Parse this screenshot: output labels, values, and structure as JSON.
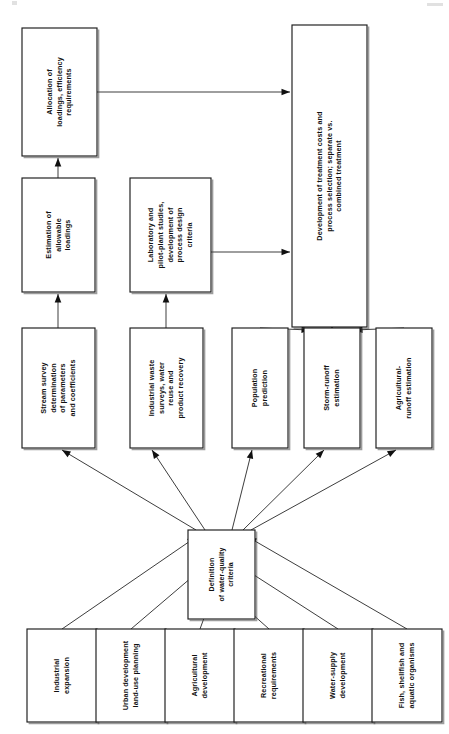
{
  "figure": {
    "orientation": "text-rotated-90-ccw",
    "page_width": 449,
    "page_height": 734,
    "ink_color": "#1a1a1a",
    "paper_color": "#ffffff"
  },
  "nodes": {
    "allocation": {
      "id": "allocation",
      "lines": [
        "Allocation of",
        "loadings, efficiency",
        "requirements"
      ],
      "x": 22,
      "y": 28,
      "w": 75,
      "h": 128,
      "font": 7.2
    },
    "treatment": {
      "id": "treatment",
      "lines": [
        "Development of treatment costs and",
        "process selection; separate vs.",
        "combined treatment"
      ],
      "x": 292,
      "y": 25,
      "w": 75,
      "h": 302,
      "font": 7.2
    },
    "estimation": {
      "id": "estimation",
      "lines": [
        "Estimation of",
        "allowable",
        "loadings"
      ],
      "x": 22,
      "y": 178,
      "w": 73,
      "h": 114,
      "font": 7.2
    },
    "laboratory": {
      "id": "laboratory",
      "lines": [
        "Laboratory and",
        "pilot-plant studies,",
        "development of",
        "process design",
        "criteria"
      ],
      "x": 130,
      "y": 178,
      "w": 81,
      "h": 114,
      "font": 7.2
    },
    "stream_survey": {
      "id": "stream_survey",
      "lines": [
        "Stream survey",
        "determination",
        "of parameters",
        "and coefficients"
      ],
      "x": 22,
      "y": 328,
      "w": 73,
      "h": 120,
      "font": 7.2
    },
    "industrial_waste": {
      "id": "industrial_waste",
      "lines": [
        "Industrial waste",
        "surveys, water",
        "reuse and",
        "product recovery"
      ],
      "x": 130,
      "y": 328,
      "w": 73,
      "h": 120,
      "font": 7.2
    },
    "population": {
      "id": "population",
      "lines": [
        "Population",
        "prediction"
      ],
      "x": 232,
      "y": 328,
      "w": 56,
      "h": 120,
      "font": 7.2
    },
    "storm_runoff": {
      "id": "storm_runoff",
      "lines": [
        "Storm-runoff",
        "estimation"
      ],
      "x": 304,
      "y": 328,
      "w": 56,
      "h": 120,
      "font": 7.2
    },
    "agri_runoff": {
      "id": "agri_runoff",
      "lines": [
        "Agricultural-",
        "runoff estimation"
      ],
      "x": 376,
      "y": 328,
      "w": 56,
      "h": 120,
      "font": 7.2
    },
    "definition": {
      "id": "definition",
      "lines": [
        "Definition",
        "of water-quality",
        "criteria"
      ],
      "x": 188,
      "y": 530,
      "w": 67,
      "h": 89,
      "font": 7.0
    },
    "industrial_expansion": {
      "id": "industrial_expansion",
      "lines": [
        "Industrial",
        "expansion"
      ],
      "x": 27,
      "y": 629,
      "w": 70,
      "h": 93,
      "font": 7.2
    },
    "urban_development": {
      "id": "urban_development",
      "lines": [
        "Urban development",
        "land-use planning"
      ],
      "x": 96,
      "y": 629,
      "w": 70,
      "h": 93,
      "font": 7.2
    },
    "agricultural_development": {
      "id": "agricultural_development",
      "lines": [
        "Agricultural",
        "development"
      ],
      "x": 165,
      "y": 629,
      "w": 70,
      "h": 93,
      "font": 7.2
    },
    "recreational": {
      "id": "recreational",
      "lines": [
        "Recreational",
        "requirements"
      ],
      "x": 234,
      "y": 629,
      "w": 70,
      "h": 93,
      "font": 7.2
    },
    "water_supply": {
      "id": "water_supply",
      "lines": [
        "Water-supply",
        "development"
      ],
      "x": 303,
      "y": 629,
      "w": 70,
      "h": 93,
      "font": 7.2
    },
    "fish_shellfish": {
      "id": "fish_shellfish",
      "lines": [
        "Fish, shellfish and",
        "aquatic organisms"
      ],
      "x": 372,
      "y": 629,
      "w": 70,
      "h": 93,
      "font": 7.2
    }
  },
  "edges": [
    {
      "id": "e-ind-exp-def",
      "from": "industrial_expansion",
      "to": "definition",
      "points": [
        [
          62,
          629
        ],
        [
          196,
          537
        ]
      ],
      "arrow": "end"
    },
    {
      "id": "e-urban-def",
      "from": "urban_development",
      "to": "definition",
      "points": [
        [
          131,
          629
        ],
        [
          205,
          566
        ]
      ],
      "arrow": "end"
    },
    {
      "id": "e-agri-dev-def",
      "from": "agricultural_development",
      "to": "definition",
      "points": [
        [
          200,
          629
        ],
        [
          212,
          596
        ]
      ],
      "arrow": "end"
    },
    {
      "id": "e-recr-def",
      "from": "recreational",
      "to": "definition",
      "points": [
        [
          269,
          629
        ],
        [
          232,
          596
        ]
      ],
      "arrow": "end"
    },
    {
      "id": "e-water-def",
      "from": "water_supply",
      "to": "definition",
      "points": [
        [
          338,
          629
        ],
        [
          240,
          566
        ]
      ],
      "arrow": "end"
    },
    {
      "id": "e-fish-def",
      "from": "fish_shellfish",
      "to": "definition",
      "points": [
        [
          407,
          629
        ],
        [
          248,
          537
        ]
      ],
      "arrow": "end"
    },
    {
      "id": "e-def-stream",
      "from": "definition",
      "to": "stream_survey",
      "points": [
        [
          196,
          530
        ],
        [
          62,
          450
        ]
      ],
      "arrow": "end"
    },
    {
      "id": "e-def-indwaste",
      "from": "definition",
      "to": "industrial_waste",
      "points": [
        [
          205,
          530
        ],
        [
          152,
          450
        ]
      ],
      "arrow": "end"
    },
    {
      "id": "e-def-pop",
      "from": "definition",
      "to": "population",
      "points": [
        [
          232,
          530
        ],
        [
          252,
          450
        ]
      ],
      "arrow": "end"
    },
    {
      "id": "e-def-storm",
      "from": "definition",
      "to": "storm_runoff",
      "points": [
        [
          243,
          530
        ],
        [
          324,
          450
        ]
      ],
      "arrow": "end"
    },
    {
      "id": "e-def-agri",
      "from": "definition",
      "to": "agri_runoff",
      "points": [
        [
          251,
          530
        ],
        [
          396,
          450
        ]
      ],
      "arrow": "end"
    },
    {
      "id": "e-stream-est",
      "from": "stream_survey",
      "to": "estimation",
      "points": [
        [
          58,
          328
        ],
        [
          58,
          294
        ]
      ],
      "arrow": "end"
    },
    {
      "id": "e-indwaste-lab",
      "from": "industrial_waste",
      "to": "laboratory",
      "points": [
        [
          166,
          328
        ],
        [
          166,
          294
        ]
      ],
      "arrow": "end"
    },
    {
      "id": "e-est-alloc",
      "from": "estimation",
      "to": "allocation",
      "points": [
        [
          58,
          178
        ],
        [
          58,
          158
        ]
      ],
      "arrow": "end"
    },
    {
      "id": "e-alloc-treat",
      "from": "allocation",
      "to": "treatment",
      "points": [
        [
          97,
          92
        ],
        [
          290,
          92
        ]
      ],
      "arrow": "end"
    },
    {
      "id": "e-lab-treat",
      "from": "laboratory",
      "to": "treatment",
      "points": [
        [
          211,
          252
        ],
        [
          290,
          252
        ]
      ],
      "arrow": "end"
    },
    {
      "id": "e-pop-treat",
      "from": "population",
      "to": "treatment",
      "points": [
        [
          260,
          328
        ],
        [
          310,
          330
        ]
      ],
      "arrow": "end"
    },
    {
      "id": "e-storm-treat",
      "from": "storm_runoff",
      "to": "treatment",
      "points": [
        [
          332,
          328
        ],
        [
          332,
          330
        ]
      ],
      "arrow": "end"
    },
    {
      "id": "e-agri-treat",
      "from": "agri_runoff",
      "to": "treatment",
      "points": [
        [
          404,
          328
        ],
        [
          354,
          330
        ]
      ],
      "arrow": "end"
    }
  ]
}
